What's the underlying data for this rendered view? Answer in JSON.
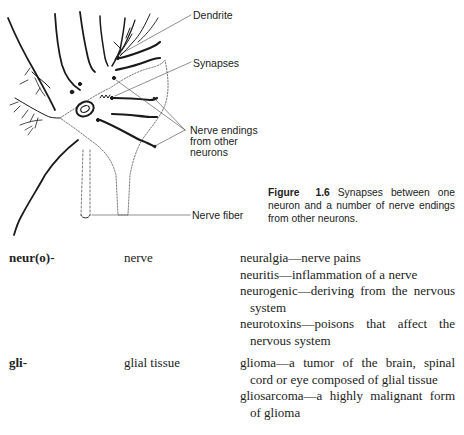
{
  "figure": {
    "labels": {
      "dendrite": "Dendrite",
      "synapses": "Synapses",
      "nerve_endings_line1": "Nerve endings",
      "nerve_endings_line2": "from other",
      "nerve_endings_line3": "neurons",
      "nerve_fiber": "Nerve fiber"
    },
    "caption": {
      "figure_label": "Figure",
      "figure_number": "1.6",
      "text": "Synapses between one neuron and a number of nerve endings from other neurons."
    }
  },
  "entries": [
    {
      "root": "neur(o)-",
      "meaning": "nerve",
      "definitions": [
        "neuralgia—nerve pains",
        "neuritis—inflammation of a nerve",
        "neurogenic—deriving from the nervous system",
        "neurotoxins—poisons that affect the nervous system"
      ]
    },
    {
      "root": "gli-",
      "meaning": "glial tissue",
      "definitions": [
        "glioma—a tumor of the brain, spinal cord or eye composed of glial tissue",
        "gliosarcoma—a highly malignant form of glioma"
      ]
    }
  ]
}
